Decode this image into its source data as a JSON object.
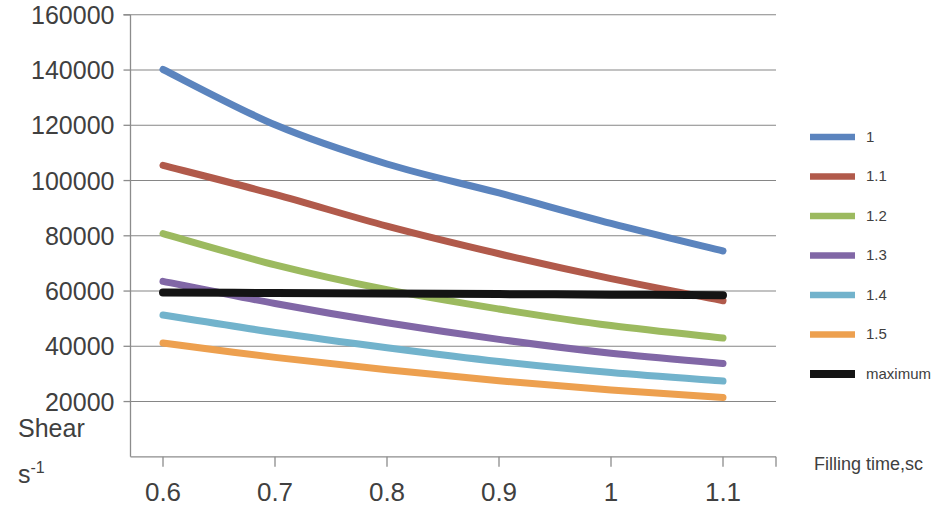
{
  "chart_data": {
    "type": "line",
    "title": "",
    "xlabel": "Filling time,sc",
    "ylabel_line1": "Shear",
    "ylabel_line2": "s",
    "ylabel_line2_sup": "-1",
    "x": [
      0.6,
      0.7,
      0.8,
      0.9,
      1.0,
      1.1
    ],
    "xticks": [
      "0.6",
      "0.7",
      "0.8",
      "0.9",
      "1",
      "1.1"
    ],
    "yticks": [
      "20000",
      "40000",
      "60000",
      "80000",
      "100000",
      "120000",
      "140000",
      "160000"
    ],
    "ylim": [
      0,
      160000
    ],
    "xlim": [
      0.55,
      1.15
    ],
    "grid": true,
    "legend_position": "right",
    "series": [
      {
        "name": "1",
        "color": "#5B84BE",
        "width": 7,
        "values": [
          140200,
          120200,
          106000,
          95500,
          84500,
          74500
        ]
      },
      {
        "name": "1.1",
        "color": "#B15A4B",
        "width": 7,
        "values": [
          105500,
          95000,
          83500,
          73500,
          64500,
          56500
        ]
      },
      {
        "name": "1.2",
        "color": "#9CBA5F",
        "width": 7,
        "values": [
          80800,
          69500,
          60500,
          53500,
          47500,
          43000
        ]
      },
      {
        "name": "1.3",
        "color": "#8167A6",
        "width": 7,
        "values": [
          63500,
          55500,
          48500,
          42500,
          37500,
          33800
        ]
      },
      {
        "name": "1.4",
        "color": "#72B3CC",
        "width": 7,
        "values": [
          51300,
          45000,
          39500,
          34500,
          30500,
          27400
        ]
      },
      {
        "name": "1.5",
        "color": "#EDA04F",
        "width": 7,
        "values": [
          41200,
          36000,
          31500,
          27500,
          24200,
          21500
        ]
      },
      {
        "name": "maximum",
        "color": "#141414",
        "width": 8,
        "values": [
          59500,
          59300,
          59100,
          58900,
          58700,
          58500
        ]
      }
    ]
  },
  "legend": {
    "entries": [
      "1",
      "1.1",
      "1.2",
      "1.3",
      "1.4",
      "1.5",
      "maximum"
    ]
  }
}
